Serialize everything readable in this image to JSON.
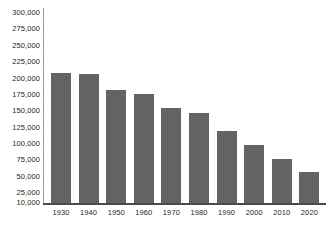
{
  "chart_data": {
    "type": "bar",
    "title": "",
    "subtitle": "",
    "xlabel": "",
    "ylabel": "",
    "categories": [
      "1930",
      "1940",
      "1950",
      "1960",
      "1970",
      "1980",
      "1990",
      "2000",
      "2010",
      "2020"
    ],
    "values": [
      208000,
      207000,
      182000,
      176000,
      155000,
      147000,
      120000,
      99000,
      77000,
      57000
    ],
    "series": [
      {
        "name": "",
        "values": [
          208000,
          207000,
          182000,
          176000,
          155000,
          147000,
          120000,
          99000,
          77000,
          57000
        ]
      }
    ],
    "ylim": [
      10000,
      300000
    ],
    "yticks": [
      10000,
      25000,
      50000,
      75000,
      100000,
      125000,
      150000,
      175000,
      200000,
      225000,
      250000,
      275000,
      300000
    ],
    "ytick_labels": [
      "10,000",
      "25,000",
      "50,000",
      "75,000",
      "100,000",
      "125,000",
      "150,000",
      "175,000",
      "200,000",
      "225,000",
      "250,000",
      "275,000",
      "300,000"
    ],
    "xtick_labels": [
      "1930",
      "1940",
      "1950",
      "1960",
      "1970",
      "1980",
      "1990",
      "2000",
      "2010",
      "2020"
    ],
    "grid": false,
    "legend": false,
    "legend_position": "none",
    "bar_color": "#636363",
    "axis_color": "#4a4a4a",
    "text_color": "#231f20",
    "background_color": "#ffffff",
    "annotations": []
  },
  "axes": {
    "y_labels": [
      {
        "text": "300,000",
        "value": 300000
      },
      {
        "text": "275,000",
        "value": 275000
      },
      {
        "text": "250,000",
        "value": 250000
      },
      {
        "text": "225,000",
        "value": 225000
      },
      {
        "text": "200,000",
        "value": 200000
      },
      {
        "text": "175,000",
        "value": 175000
      },
      {
        "text": "150,000",
        "value": 150000
      },
      {
        "text": "125,000",
        "value": 125000
      },
      {
        "text": "100,000",
        "value": 100000
      },
      {
        "text": "75,000",
        "value": 75000
      },
      {
        "text": "50,000",
        "value": 50000
      },
      {
        "text": "25,000",
        "value": 25000
      },
      {
        "text": "10,000",
        "value": 10000
      }
    ],
    "x_labels": [
      {
        "text": "1930"
      },
      {
        "text": "1940"
      },
      {
        "text": "1950"
      },
      {
        "text": "1960"
      },
      {
        "text": "1970"
      },
      {
        "text": "1980"
      },
      {
        "text": "1990"
      },
      {
        "text": "2000"
      },
      {
        "text": "2010"
      },
      {
        "text": "2020"
      }
    ]
  }
}
